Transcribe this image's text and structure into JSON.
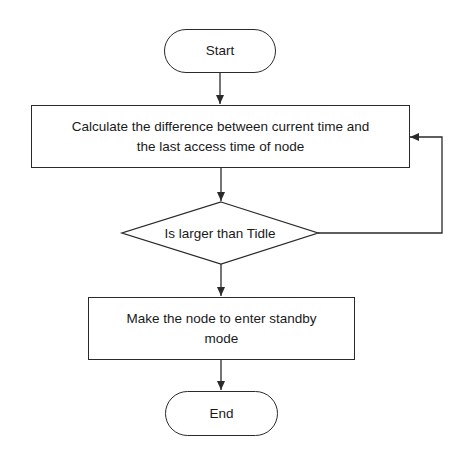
{
  "diagram": {
    "type": "flowchart",
    "colors": {
      "stroke": "#2a2a2a",
      "fill": "#ffffff",
      "text": "#1a1a1a",
      "background": "#ffffff"
    },
    "nodes": {
      "start": {
        "shape": "terminal",
        "label": "Start"
      },
      "calculate": {
        "shape": "process",
        "label": "Calculate the difference between current time and\nthe last access time of node"
      },
      "decision": {
        "shape": "decision",
        "label": "Is larger than Tidle"
      },
      "standby": {
        "shape": "process",
        "label": "Make the node to enter standby\nmode"
      },
      "end": {
        "shape": "terminal",
        "label": "End"
      }
    },
    "edges": [
      {
        "from": "start",
        "to": "calculate",
        "label": ""
      },
      {
        "from": "calculate",
        "to": "decision",
        "label": ""
      },
      {
        "from": "decision",
        "to": "standby",
        "label": ""
      },
      {
        "from": "decision",
        "to": "calculate",
        "label": "",
        "route": "right-loop-back"
      },
      {
        "from": "standby",
        "to": "end",
        "label": ""
      }
    ]
  }
}
